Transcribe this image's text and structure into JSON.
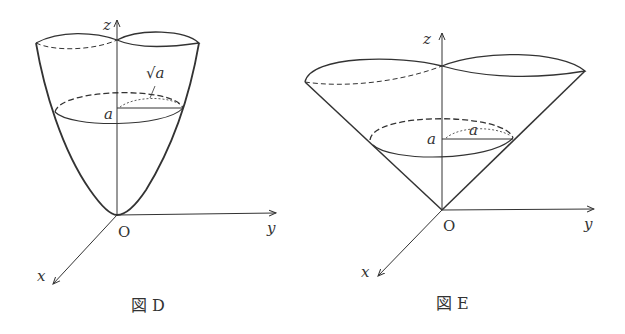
{
  "figures": [
    {
      "id": "D",
      "caption": "図 D",
      "surface": "paraboloid",
      "labels": {
        "z_axis": "z",
        "y_axis": "y",
        "x_axis": "x",
        "origin": "O",
        "height": "a",
        "radius": "√a"
      }
    },
    {
      "id": "E",
      "caption": "図 E",
      "surface": "cone",
      "labels": {
        "z_axis": "z",
        "y_axis": "y",
        "x_axis": "x",
        "origin": "O",
        "height": "a",
        "radius": "a"
      }
    }
  ],
  "colors": {
    "stroke": "#333333",
    "background": "#ffffff"
  }
}
